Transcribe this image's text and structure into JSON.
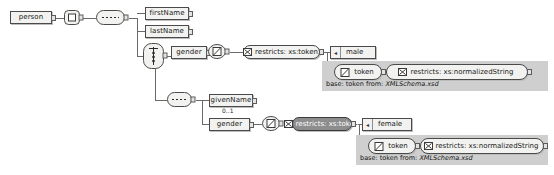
{
  "diagram": {
    "type": "xml-schema-diagram",
    "background": "#ffffff",
    "selected_node_color": "#8d8d8d",
    "panel_color": "#cfcfcf"
  },
  "root": {
    "element_label": "person",
    "complextype_icon": "complextype-icon",
    "sequence_icon": "sequence-icon"
  },
  "children": {
    "first_name": {
      "label": "firstName"
    },
    "last_name": {
      "label": "lastName"
    },
    "choice_icon": "choice-icon"
  },
  "branch_top": {
    "gender": {
      "label": "gender"
    },
    "simpletype_icon": "simpletype-icon",
    "restriction": {
      "label": "restricts: xs:token",
      "icon": "restriction-icon"
    },
    "enumeration": {
      "label": "male",
      "marker": "enum-marker-icon"
    },
    "panel": {
      "base_node": {
        "label": "token",
        "icon": "simpletype-icon"
      },
      "restriction": {
        "label": "restricts: xs:normalizedString",
        "icon": "restriction-icon"
      },
      "caption_prefix": "base: token from: ",
      "caption_file": "XMLSchema.xsd"
    }
  },
  "branch_bottom": {
    "sequence_icon": "sequence-icon",
    "given_name": {
      "label": "givenName",
      "occurrence": "0..1"
    },
    "gender": {
      "label": "gender"
    },
    "simpletype_icon": "simpletype-icon",
    "restriction": {
      "label": "restricts: xs:token",
      "icon": "restriction-icon",
      "selected": true
    },
    "enumeration": {
      "label": "female",
      "marker": "enum-marker-icon"
    },
    "panel": {
      "base_node": {
        "label": "token",
        "icon": "simpletype-icon"
      },
      "restriction": {
        "label": "restricts: xs:normalizedString",
        "icon": "restriction-icon"
      },
      "caption_prefix": "base: token from: ",
      "caption_file": "XMLSchema.xsd"
    }
  }
}
